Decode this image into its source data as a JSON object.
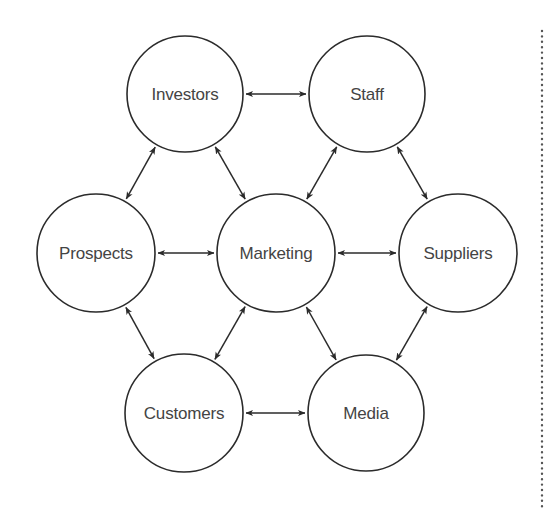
{
  "diagram": {
    "title": "",
    "colors": {
      "stroke": "#2b2b2b",
      "text": "#444444",
      "background": "#ffffff",
      "dotted_rule": "#555555"
    },
    "nodes": [
      {
        "id": "investors",
        "label": "Investors",
        "cx": 185,
        "cy": 94,
        "r": 58
      },
      {
        "id": "staff",
        "label": "Staff",
        "cx": 367,
        "cy": 94,
        "r": 58
      },
      {
        "id": "prospects",
        "label": "Prospects",
        "cx": 96,
        "cy": 253,
        "r": 59
      },
      {
        "id": "marketing",
        "label": "Marketing",
        "cx": 276,
        "cy": 253,
        "r": 59
      },
      {
        "id": "suppliers",
        "label": "Suppliers",
        "cx": 458,
        "cy": 253,
        "r": 59
      },
      {
        "id": "customers",
        "label": "Customers",
        "cx": 184,
        "cy": 413,
        "r": 59
      },
      {
        "id": "media",
        "label": "Media",
        "cx": 366,
        "cy": 413,
        "r": 58
      }
    ],
    "edges": [
      {
        "from": "investors",
        "to": "staff",
        "bidirectional": true
      },
      {
        "from": "investors",
        "to": "prospects",
        "bidirectional": true
      },
      {
        "from": "investors",
        "to": "marketing",
        "bidirectional": true
      },
      {
        "from": "staff",
        "to": "marketing",
        "bidirectional": true
      },
      {
        "from": "staff",
        "to": "suppliers",
        "bidirectional": true
      },
      {
        "from": "prospects",
        "to": "marketing",
        "bidirectional": true
      },
      {
        "from": "marketing",
        "to": "suppliers",
        "bidirectional": true
      },
      {
        "from": "prospects",
        "to": "customers",
        "bidirectional": true
      },
      {
        "from": "marketing",
        "to": "customers",
        "bidirectional": true
      },
      {
        "from": "marketing",
        "to": "media",
        "bidirectional": true
      },
      {
        "from": "suppliers",
        "to": "media",
        "bidirectional": true
      },
      {
        "from": "customers",
        "to": "media",
        "bidirectional": true
      }
    ],
    "dotted_rule": {
      "x": 542,
      "y1": 31,
      "y2": 510
    }
  }
}
